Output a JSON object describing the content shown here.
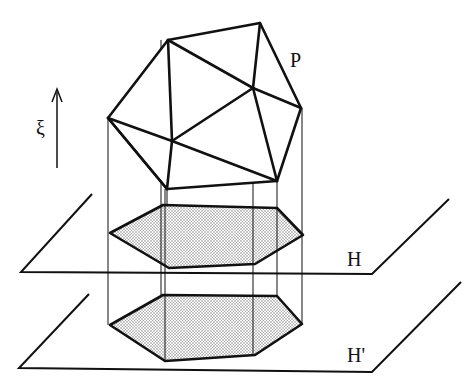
{
  "figure": {
    "labels": {
      "polyhedron": "P",
      "plane_upper": "H",
      "plane_lower": "H'",
      "direction": "ξ"
    },
    "colors": {
      "stroke": "#111111",
      "background": "#ffffff",
      "shade": "#d9d9d9"
    },
    "polyhedron_vertices": {
      "A": [
        168,
        40
      ],
      "B": [
        260,
        23
      ],
      "C": [
        108,
        118
      ],
      "D": [
        253,
        88
      ],
      "E": [
        301,
        108
      ],
      "F": [
        172,
        141
      ],
      "G": [
        167,
        189
      ],
      "I": [
        277,
        181
      ]
    },
    "projection_H": [
      [
        110,
        233
      ],
      [
        163,
        205
      ],
      [
        277,
        208
      ],
      [
        303,
        235
      ],
      [
        255,
        264
      ],
      [
        169,
        268
      ]
    ],
    "projection_H_prime": [
      [
        110,
        325
      ],
      [
        163,
        295
      ],
      [
        277,
        296
      ],
      [
        302,
        324
      ],
      [
        255,
        355
      ],
      [
        165,
        361
      ]
    ]
  }
}
